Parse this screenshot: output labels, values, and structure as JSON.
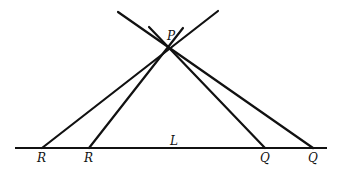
{
  "diagram": {
    "width": 337,
    "height": 176,
    "colors": {
      "line": "#111111",
      "background": "#ffffff"
    },
    "points": {
      "P": {
        "label": "P",
        "x": 168,
        "y": 50,
        "label_x": 167,
        "label_y": 40
      },
      "R1": {
        "label": "R",
        "x": 42,
        "y": 148,
        "label_x": 37,
        "label_y": 162
      },
      "R2": {
        "label": "R",
        "x": 89,
        "y": 148,
        "label_x": 84,
        "label_y": 162
      },
      "Q1": {
        "label": "Q",
        "x": 265,
        "y": 148,
        "label_x": 260,
        "label_y": 162
      },
      "Q2": {
        "label": "Q",
        "x": 313,
        "y": 148,
        "label_x": 308,
        "label_y": 162
      }
    },
    "line_L": {
      "label": "L",
      "x1": 15,
      "y1": 148,
      "x2": 327,
      "y2": 148,
      "label_x": 170,
      "label_y": 145
    },
    "lines": [
      {
        "name": "line-p-r1",
        "x1": 218,
        "y1": 11,
        "x2": 42,
        "y2": 148
      },
      {
        "name": "line-p-r2",
        "x1": 183,
        "y1": 28,
        "x2": 89,
        "y2": 148
      },
      {
        "name": "line-p-q1",
        "x1": 149,
        "y1": 27,
        "x2": 265,
        "y2": 148
      },
      {
        "name": "line-p-q2",
        "x1": 118,
        "y1": 12,
        "x2": 313,
        "y2": 148
      }
    ]
  }
}
